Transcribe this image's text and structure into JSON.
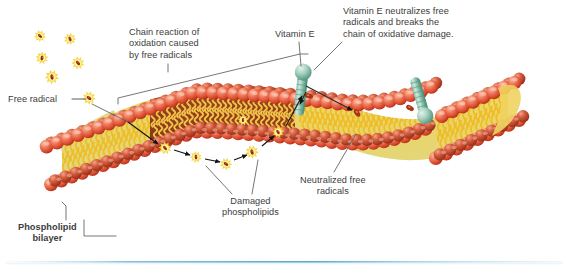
{
  "figure": {
    "kind": "scientific-illustration",
    "background_color": "#ffffff",
    "text_color": "#3c3c3c",
    "footer_rule_color": "#6fb8dd"
  },
  "labels": {
    "chain_reaction": "Chain reaction of\noxidation caused\nby free radicals",
    "free_radical": "Free radical",
    "vitamin_e": "Vitamin E",
    "vitamin_e_action": "Vitamin E neutralizes free\nradicals and breaks the\nchain of oxidative damage.",
    "damaged_phospholipids": "Damaged\nphospholipids",
    "neutralized_free_radicals": "Neutralized free\nradicals",
    "phospholipid_bilayer": "Phospholipid\nbilayer"
  },
  "palette": {
    "head_red_light": "#f08a72",
    "head_red": "#e2553a",
    "head_red_dark": "#b8321d",
    "tail_yellow_light": "#f7e27a",
    "tail_yellow": "#f2c12e",
    "tail_yellow_dark": "#d59a14",
    "interior_green": "#d8d98a",
    "damaged_brown_light": "#b5562c",
    "damaged_brown": "#8e3d1c",
    "damaged_brown_dark": "#6a2a12",
    "radical_glow": "#f5e04a",
    "radical_core": "#9c2310",
    "vitamin_e_teal_light": "#bfe0d2",
    "vitamin_e_teal": "#7fbda6",
    "vitamin_e_teal_dark": "#3f8f77",
    "leader_line": "#5a5a5a",
    "arrow_black": "#1a1a1a"
  },
  "chart_data": {
    "type": "diagram",
    "title": "Chain reaction of oxidation caused by free radicals",
    "regions": [
      {
        "name": "healthy-bilayer-left",
        "state": "intact",
        "note": "ordered phospholipid lattice, cross-section visible"
      },
      {
        "name": "damaged-bilayer-center",
        "state": "oxidized",
        "note": "dark brown interior, kinked tails, propagating radicals"
      },
      {
        "name": "healthy-bilayer-right",
        "state": "protected",
        "note": "vitamin E embedded, radicals neutralized"
      }
    ],
    "free_radicals_floating": 6,
    "free_radicals_in_membrane": 6,
    "neutralized_radicals": 3,
    "vitamin_e_molecules": 2,
    "chain_reaction_arrows": 5
  }
}
